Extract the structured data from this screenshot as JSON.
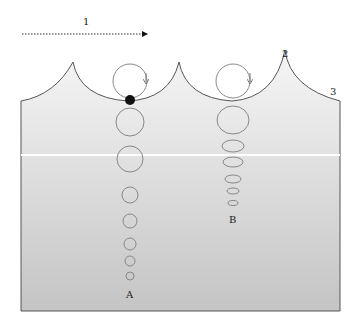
{
  "diagram": {
    "labels": {
      "direction": "1",
      "crest": "2",
      "surface": "3",
      "deep_water": "A",
      "shallow_water": "B"
    },
    "colors": {
      "water_top": "#f4f4f4",
      "water_bottom": "#c9c9c9",
      "outline": "#555555",
      "orbit": "#888888",
      "particle": "#111111"
    },
    "orbits_A": [
      {
        "cy": 81,
        "rx": 16,
        "ry": 16
      },
      {
        "cy": 123,
        "rx": 14,
        "ry": 14
      },
      {
        "cy": 160,
        "rx": 13,
        "ry": 13
      },
      {
        "cy": 195,
        "rx": 8,
        "ry": 8
      },
      {
        "cy": 221,
        "rx": 7,
        "ry": 7
      },
      {
        "cy": 244,
        "rx": 6,
        "ry": 6
      },
      {
        "cy": 261,
        "rx": 5,
        "ry": 5
      },
      {
        "cy": 276,
        "rx": 4,
        "ry": 4
      }
    ],
    "orbits_B": [
      {
        "cy": 81,
        "rx": 16,
        "ry": 16
      },
      {
        "cy": 119,
        "rx": 16,
        "ry": 13
      },
      {
        "cy": 146,
        "rx": 11,
        "ry": 6
      },
      {
        "cy": 162,
        "rx": 10,
        "ry": 5
      },
      {
        "cy": 179,
        "rx": 8,
        "ry": 4
      },
      {
        "cy": 191,
        "rx": 6,
        "ry": 3
      },
      {
        "cy": 203,
        "rx": 5,
        "ry": 2.5
      }
    ]
  }
}
